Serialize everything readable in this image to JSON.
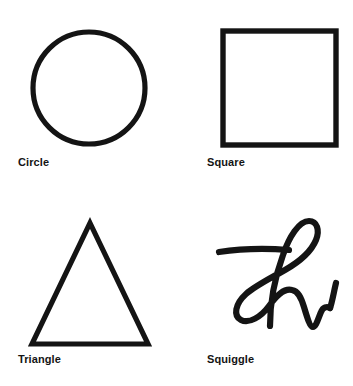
{
  "page": {
    "background_color": "#ffffff",
    "ink_color": "#141414",
    "width": 353,
    "height": 386,
    "layout": "2x2 grid of outlined shape figures, each with a bold caption below"
  },
  "figure": {
    "caption_style": "bold sans-serif, left aligned under each shape",
    "items": [
      {
        "id": "circle",
        "label": "Circle",
        "icon_name": "circle-outline-icon",
        "stroke_width": 5,
        "geometry": {
          "cx": 89,
          "cy": 88,
          "r": 56
        }
      },
      {
        "id": "square",
        "label": "Square",
        "icon_name": "square-outline-icon",
        "stroke_width": 5,
        "geometry": {
          "x": 44,
          "y": 29,
          "w": 114,
          "h": 116
        }
      },
      {
        "id": "triangle",
        "label": "Triangle",
        "icon_name": "triangle-outline-icon",
        "stroke_width": 5,
        "geometry": {
          "apex_x": 90,
          "apex_y": 30,
          "left_x": 32,
          "right_x": 148,
          "base_y": 151
        }
      },
      {
        "id": "squiggle",
        "label": "Squiggle",
        "icon_name": "squiggle-scribble-icon",
        "stroke_width": 6,
        "geometry": {
          "x": 40,
          "y": 22,
          "w": 108,
          "h": 112
        }
      }
    ]
  }
}
